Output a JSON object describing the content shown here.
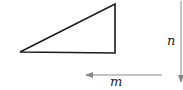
{
  "diagram": {
    "type": "geometry",
    "shapes": [
      {
        "kind": "right-triangle",
        "vertices": [
          [
            20,
            52
          ],
          [
            115,
            4
          ],
          [
            115,
            53
          ]
        ],
        "stroke": "#1a1a1a"
      }
    ],
    "arrows": [
      {
        "id": "m",
        "label": "m",
        "direction": "left",
        "from": [
          162,
          75
        ],
        "to": [
          84,
          75
        ],
        "color": "#888888"
      },
      {
        "id": "n",
        "label": "n",
        "direction": "down",
        "from": [
          181,
          1
        ],
        "to": [
          181,
          83
        ],
        "color": "#888888"
      }
    ]
  },
  "labels": {
    "m": "m",
    "n": "n"
  }
}
